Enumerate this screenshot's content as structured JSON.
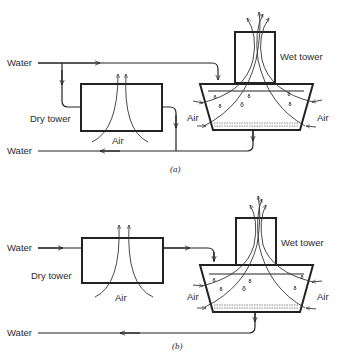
{
  "figure": {
    "panels": [
      {
        "id": "a",
        "caption": "(a)",
        "labels": {
          "water_in": "Water",
          "water_out": "Water",
          "dry_tower": "Dry tower",
          "dry_air": "Air",
          "wet_tower": "Wet tower",
          "air_left": "Air",
          "air_right": "Air"
        },
        "description": "Parallel arrangement: incoming water splits between dry tower and wet tower; both return to common outlet"
      },
      {
        "id": "b",
        "caption": "(b)",
        "labels": {
          "water_in": "Water",
          "water_out": "Water",
          "dry_tower": "Dry tower",
          "dry_air": "Air",
          "wet_tower": "Wet tower",
          "air_left": "Air",
          "air_right": "Air"
        },
        "description": "Series arrangement: water passes through dry tower then into wet tower before exiting"
      }
    ],
    "colors": {
      "stroke": "#222222",
      "background": "#ffffff"
    }
  }
}
